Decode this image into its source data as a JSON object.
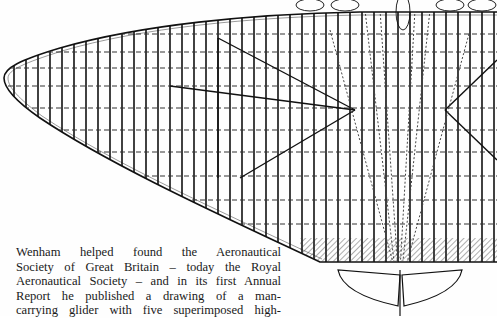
{
  "figure": {
    "ink_color": "#111111",
    "paper_color": "#fefefe"
  },
  "caption": {
    "lines": [
      "Wenham helped found the Aeronautical",
      "Society of Great Britain – today the Royal",
      "Aeronautical Society – and in its first Annual",
      "Report he published a drawing of a man-",
      "carrying glider with five superimposed high-"
    ]
  }
}
